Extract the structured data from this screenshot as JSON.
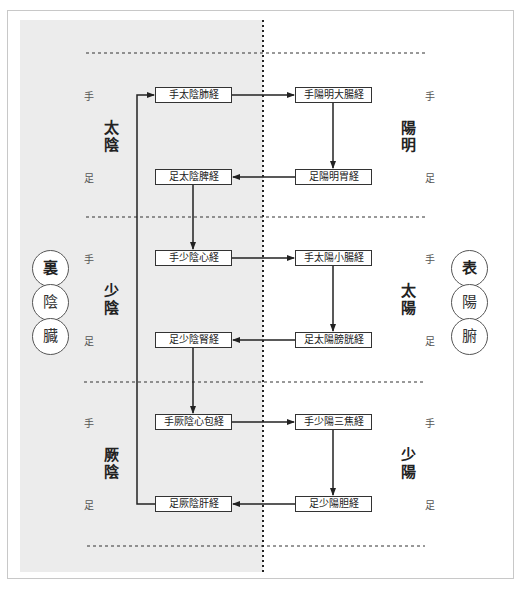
{
  "diagram": {
    "sides": {
      "left": {
        "circles": [
          "裏",
          "陰",
          "臓"
        ],
        "groups": [
          {
            "name_top": "太",
            "name_bottom": "陰",
            "hand": "手",
            "foot": "足",
            "hand_meridian": "手太陰肺経",
            "foot_meridian": "足太陰脾経"
          },
          {
            "name_top": "少",
            "name_bottom": "陰",
            "hand": "手",
            "foot": "足",
            "hand_meridian": "手少陰心経",
            "foot_meridian": "足少陰腎経"
          },
          {
            "name_top": "厥",
            "name_bottom": "陰",
            "hand": "手",
            "foot": "足",
            "hand_meridian": "手厥陰心包経",
            "foot_meridian": "足厥陰肝経"
          }
        ]
      },
      "right": {
        "circles": [
          "表",
          "陽",
          "腑"
        ],
        "groups": [
          {
            "name_top": "陽",
            "name_bottom": "明",
            "hand": "手",
            "foot": "足",
            "hand_meridian": "手陽明大腸経",
            "foot_meridian": "足陽明胃経"
          },
          {
            "name_top": "太",
            "name_bottom": "陽",
            "hand": "手",
            "foot": "足",
            "hand_meridian": "手太陽小腸経",
            "foot_meridian": "足太陽膀胱経"
          },
          {
            "name_top": "少",
            "name_bottom": "陽",
            "hand": "手",
            "foot": "足",
            "hand_meridian": "手少陽三焦経",
            "foot_meridian": "足少陽胆経"
          }
        ]
      }
    },
    "flow_order": [
      "手太陰肺経",
      "手陽明大腸経",
      "足陽明胃経",
      "足太陰脾経",
      "手少陰心経",
      "手太陽小腸経",
      "足太陽膀胱経",
      "足少陰腎経",
      "手厥陰心包経",
      "手少陽三焦経",
      "足少陽胆経",
      "足厥陰肝経"
    ],
    "colors": {
      "yin_panel": "#ececec",
      "line": "#222222",
      "frame": "#c8c8c8"
    }
  }
}
